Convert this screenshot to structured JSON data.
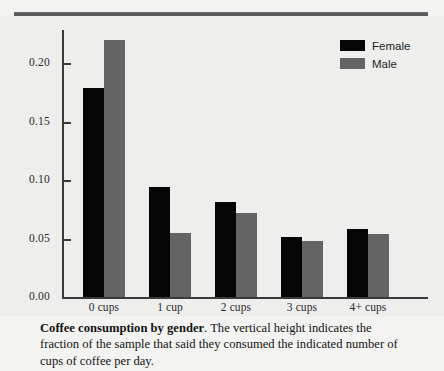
{
  "chart_data": {
    "type": "bar",
    "title": "Coffee consumption by gender",
    "xlabel": "",
    "ylabel": "",
    "categories": [
      "0 cups",
      "1 cup",
      "2 cups",
      "3 cups",
      "4+ cups"
    ],
    "series": [
      {
        "name": "Female",
        "color": "#060606",
        "values": [
          0.179,
          0.094,
          0.081,
          0.051,
          0.058
        ]
      },
      {
        "name": "Male",
        "color": "#646464",
        "values": [
          0.22,
          0.055,
          0.072,
          0.048,
          0.054
        ]
      }
    ],
    "ylim": [
      0.0,
      0.225
    ],
    "yticks": [
      0.0,
      0.05,
      0.1,
      0.15,
      0.2
    ],
    "ytick_labels": [
      "0.00",
      "0.05",
      "0.10",
      "0.15",
      "0.20"
    ],
    "grid": false,
    "legend_position": "top-right",
    "legend_entries": [
      "Female",
      "Male"
    ]
  },
  "legend": {
    "female_label": "Female",
    "male_label": "Male"
  },
  "caption": {
    "bold_lead": "Coffee consumption by gender",
    "rest": ". The vertical height indicates the fraction of the sample that said they consumed the indicated number of cups of coffee per day."
  }
}
